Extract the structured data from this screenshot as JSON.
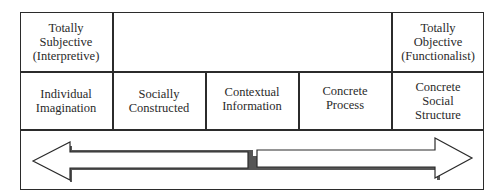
{
  "diagram": {
    "header_row": {
      "left": "Totally\nSubjective\n(Interpretive)",
      "middle": "",
      "right": "Totally\nObjective\n(Functionalist)"
    },
    "continuum_row": [
      {
        "label": "Individual\nImagination"
      },
      {
        "label": "Socially\nConstructed"
      },
      {
        "label": "Contextual\nInformation"
      },
      {
        "label": "Concrete\nProcess"
      },
      {
        "label": "Concrete\nSocial\nStructure"
      }
    ],
    "arrows": {
      "left": {
        "direction": "left",
        "icon": "left-arrow-icon"
      },
      "right": {
        "direction": "right",
        "icon": "right-arrow-icon"
      }
    },
    "colors": {
      "line": "#2b2b2b",
      "text": "#2a2a2a",
      "shadow": "#555555",
      "background": "#ffffff"
    }
  }
}
